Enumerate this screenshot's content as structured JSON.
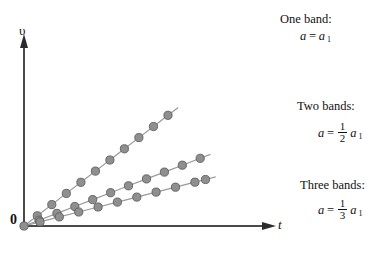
{
  "chart_data": {
    "type": "line",
    "title": "",
    "xlabel": "t",
    "ylabel": "υ",
    "origin_label": "0",
    "xlim": [
      0,
      10
    ],
    "ylim": [
      0,
      10
    ],
    "grid": false,
    "legend_position": "right-inline",
    "axis_arrows": true,
    "marker": "filled-circle",
    "marker_color": "#8f8f8f",
    "marker_edge_color": "#5e5e5e",
    "line_color": "#9a9a9a",
    "axis_color": "#4a4a4a",
    "series": [
      {
        "name": "One band",
        "label": "One band:",
        "equation_text": "a = a₁",
        "slope": 1.0,
        "x": [
          0,
          0.55,
          1.15,
          1.75,
          2.35,
          2.95,
          3.55,
          4.15,
          4.75,
          5.35,
          5.95
        ],
        "values": [
          0,
          0.55,
          1.15,
          1.75,
          2.35,
          2.95,
          3.55,
          4.15,
          4.75,
          5.35,
          5.95
        ]
      },
      {
        "name": "Two bands",
        "label": "Two bands:",
        "equation_text": "a = 1/2 a₁",
        "slope": 0.5,
        "x": [
          0,
          0.62,
          1.36,
          2.1,
          2.84,
          3.58,
          4.32,
          5.06,
          5.8,
          6.54,
          7.28
        ],
        "values": [
          0,
          0.31,
          0.68,
          1.05,
          1.42,
          1.79,
          2.16,
          2.53,
          2.9,
          3.27,
          3.64
        ]
      },
      {
        "name": "Three bands",
        "label": "Three bands:",
        "equation_text": "a = 1/3 a₁",
        "slope": 0.3333,
        "x": [
          0,
          0.66,
          1.46,
          2.26,
          3.06,
          3.86,
          4.66,
          5.46,
          6.26,
          7.06,
          7.5
        ],
        "values": [
          0,
          0.22,
          0.487,
          0.753,
          1.02,
          1.287,
          1.553,
          1.82,
          2.087,
          2.353,
          2.5
        ]
      }
    ]
  },
  "annotations": [
    {
      "title": "One band:",
      "var": "a",
      "eq": "=",
      "frac_num": "",
      "frac_den": "",
      "tail": "a",
      "sub": "1"
    },
    {
      "title": "Two bands:",
      "var": "a",
      "eq": "=",
      "frac_num": "1",
      "frac_den": "2",
      "tail": "a",
      "sub": "1"
    },
    {
      "title": "Three bands:",
      "var": "a",
      "eq": "=",
      "frac_num": "1",
      "frac_den": "3",
      "tail": "a",
      "sub": "1"
    }
  ]
}
